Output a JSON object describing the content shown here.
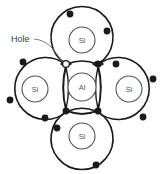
{
  "diagram": {
    "background_color": "#ffffff",
    "line_color": "#1a1a1a",
    "electron_color": "#1a1a1a",
    "hole_fill": "#ffffff",
    "label_color": "#3a3a3a",
    "atom_label_color": "#555555",
    "annotation": {
      "text": "Hole",
      "x": 12,
      "y": 39
    },
    "atoms": [
      {
        "id": "center",
        "label": "Al",
        "cx": 82,
        "cy": 87,
        "r_inner": 14,
        "r_outer": 28
      },
      {
        "id": "top",
        "label": "Si",
        "cx": 82,
        "cy": 40,
        "r_inner": 13,
        "r_outer": 31
      },
      {
        "id": "left",
        "label": "Si",
        "cx": 35,
        "cy": 89,
        "r_inner": 13,
        "r_outer": 31
      },
      {
        "id": "right",
        "label": "Si",
        "cx": 129,
        "cy": 89,
        "r_inner": 13,
        "r_outer": 31
      },
      {
        "id": "bottom",
        "label": "Si",
        "cx": 82,
        "cy": 136,
        "r_inner": 13,
        "r_outer": 31
      }
    ],
    "bonds": [
      {
        "id": "bond-top-left",
        "type": "hole",
        "orientation": "horizontal",
        "cx": 66,
        "cy": 64,
        "filled": false
      },
      {
        "id": "bond-top-right",
        "type": "electron-pair",
        "orientation": "horizontal",
        "cx": 98,
        "cy": 64,
        "filled": true
      },
      {
        "id": "bond-left",
        "type": "electron-pair",
        "orientation": "vertical",
        "cx": 66,
        "cy": 88,
        "filled": true
      },
      {
        "id": "bond-right",
        "type": "electron-pair",
        "orientation": "vertical",
        "cx": 98,
        "cy": 88,
        "filled": true
      },
      {
        "id": "bond-bottom",
        "type": "electron-pair",
        "orientation": "horizontal",
        "cx": 82,
        "cy": 111,
        "filled": true
      }
    ],
    "electron_count_outer_si": 4,
    "electron_count_al": 3,
    "hole_note": "one vacant bond position"
  }
}
